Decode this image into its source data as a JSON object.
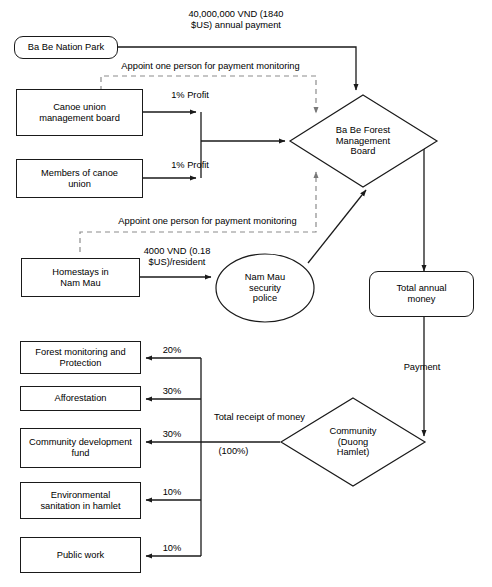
{
  "diagram": {
    "type": "flowchart",
    "nodes": {
      "ba_be_nation_park": "Ba Be Nation Park",
      "canoe_union_board": "Canoe union\nmanagement board",
      "members_of_canoe_union": "Members of canoe\nunion",
      "homestays": "Homestays in\nNam Mau",
      "nam_mau_police": "Nam Mau\nsecurity\npolice",
      "forest_management_board": "Ba Be Forest\nManagement\nBoard",
      "total_annual_money": "Total annual\nmoney",
      "community": "Community\n(Duong\nHamlet)",
      "forest_monitoring": "Forest monitoring and\nProtection",
      "afforestation": "Afforestation",
      "community_development_fund": "Community development\nfund",
      "environmental_sanitation": "Environmental\nsanitation in hamlet",
      "public_work": "Public work"
    },
    "edge_labels": {
      "annual_payment": "40,000,000 VND (1840\n$US) annual payment",
      "appoint_top": "Appoint one person for payment monitoring",
      "appoint_bottom": "Appoint one person for payment monitoring",
      "profit_canoe_board": "1% Profit",
      "profit_members": "1% Profit",
      "homestay_fee": "4000 VND (0.18\n$US)/resident",
      "payment": "Payment",
      "total_receipt": "Total receipt of money",
      "total_receipt_pct": "(100%)",
      "pct_forest_monitoring": "20%",
      "pct_afforestation": "30%",
      "pct_community_fund": "30%",
      "pct_environmental_sanitation": "10%",
      "pct_public_work": "10%"
    },
    "allocation": {
      "categories": [
        "Forest monitoring and Protection",
        "Afforestation",
        "Community development fund",
        "Environmental sanitation in hamlet",
        "Public work"
      ],
      "percentages": [
        20,
        30,
        30,
        10,
        10
      ],
      "total": "(100%)"
    },
    "colors": {
      "stroke": "#1a1a1a",
      "dashed_stroke": "#9a9a9a",
      "background": "#ffffff",
      "text": "#000000"
    }
  }
}
